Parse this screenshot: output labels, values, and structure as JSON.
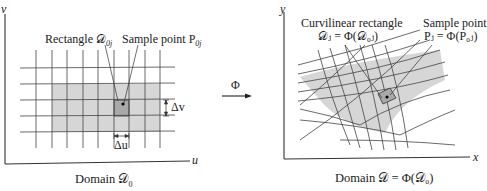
{
  "left_panel": {
    "axis_x_label": "u",
    "axis_y_label": "v",
    "rect_label": "Rectangle 𝒟",
    "rect_label_sub": "0j",
    "sample_label": "Sample point P",
    "sample_label_sub": "0j",
    "delta_u": "Δu",
    "delta_v": "Δv",
    "caption": "Domain 𝒟",
    "caption_sub": "0"
  },
  "arrow": {
    "label": "Φ"
  },
  "right_panel": {
    "axis_x_label": "x",
    "axis_y_label": "y",
    "curv_label_line1": "Curvilinear rectangle",
    "curv_label_line2": "𝒟ⱼ = Φ(𝒟₀ⱼ)",
    "sample_label_line1": "Sample point",
    "sample_label_line2": "Pⱼ = Φ(P₀ⱼ)",
    "caption": "Domain 𝒟 = Φ(𝒟₀)"
  },
  "colors": {
    "line": "#333333",
    "grid": "#444444",
    "shade_light": "#d6d6d6",
    "shade_dark": "#a9a9a9"
  }
}
